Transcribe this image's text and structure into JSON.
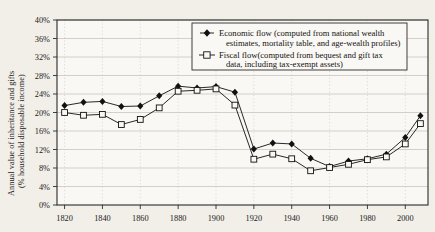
{
  "chart_data": {
    "type": "line",
    "title": "",
    "xlabel": "",
    "ylabel": "Annual value of inheritance and gifts (% household disposable income)",
    "ylabel_line1": "Annual value of inheritance and gifts",
    "ylabel_line2": "(% household disposable income)",
    "xlim": [
      1820,
      2010
    ],
    "ylim": [
      0,
      40
    ],
    "ytick_labels": [
      "0%",
      "4%",
      "8%",
      "12%",
      "16%",
      "20%",
      "24%",
      "28%",
      "32%",
      "36%",
      "40%"
    ],
    "ytick_values": [
      0,
      4,
      8,
      12,
      16,
      20,
      24,
      28,
      32,
      36,
      40
    ],
    "xtick_labels": [
      "1820",
      "1840",
      "1860",
      "1880",
      "1900",
      "1920",
      "1940",
      "1960",
      "1980",
      "2000"
    ],
    "xtick_values": [
      1820,
      1840,
      1860,
      1880,
      1900,
      1920,
      1940,
      1960,
      1980,
      2000
    ],
    "grid": true,
    "legend_position": "top-right",
    "x": [
      1820,
      1830,
      1840,
      1850,
      1860,
      1870,
      1880,
      1890,
      1900,
      1910,
      1920,
      1930,
      1940,
      1950,
      1960,
      1970,
      1980,
      1990,
      2000,
      2008
    ],
    "series": [
      {
        "name": "Economic flow (computed from national wealth estimates, mortality table, and age-wealth profiles)",
        "short_name": "Economic flow",
        "marker": "filled-diamond",
        "color": "#111111",
        "values": [
          21.5,
          22.2,
          22.4,
          21.3,
          21.4,
          23.6,
          25.7,
          25.3,
          25.6,
          24.4,
          12.1,
          13.4,
          13.2,
          10.1,
          8.3,
          9.5,
          10.0,
          11.0,
          14.6,
          19.3
        ]
      },
      {
        "name": "Fiscal flow (computed from bequest and gift tax data, including tax-exempt assets)",
        "short_name": "Fiscal flow",
        "marker": "open-square",
        "color": "#111111",
        "values": [
          20.0,
          19.4,
          19.6,
          17.4,
          18.5,
          21.0,
          24.6,
          24.8,
          25.1,
          21.6,
          9.9,
          11.0,
          10.0,
          7.4,
          8.1,
          8.8,
          9.8,
          10.4,
          13.2,
          17.6
        ]
      }
    ],
    "legend_entries": [
      {
        "marker": "filled-diamond",
        "line1": "Economic flow (computed from national wealth",
        "line2": "estimates, mortality table, and age-wealth profiles)"
      },
      {
        "marker": "open-square",
        "line1": "Fiscal flow(computed from bequest and gift tax",
        "line2": "data, including tax-exempt assets)"
      }
    ],
    "colors": {
      "background": "#f2efe9",
      "plot_background": "#faf8f4",
      "axis": "#2b2b2b",
      "gridline": "#b9b6b0",
      "vertical_gridline": "#c9c6c0",
      "series_line": "#111111"
    }
  }
}
